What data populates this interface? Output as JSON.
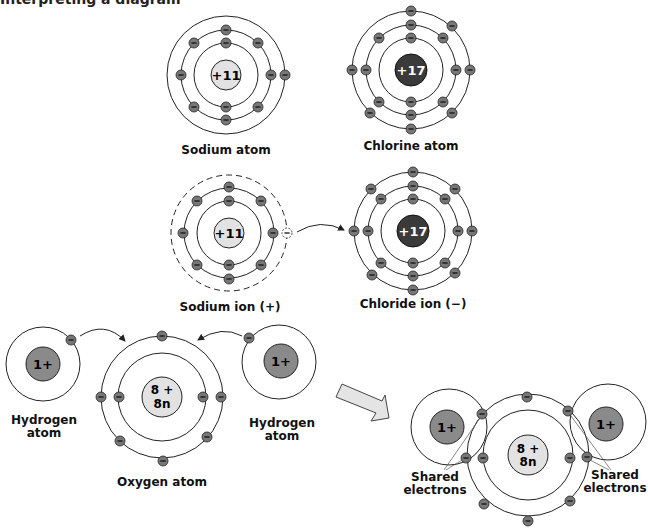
{
  "header": {
    "clipped_text": "Interpreting a diagram"
  },
  "colors": {
    "light_nucleus": "#e2e2e2",
    "dark_nucleus": "#3a3a3a",
    "mid_nucleus": "#8a8a8a",
    "electron": "#777777",
    "arrow_fill": "#e4e4e4"
  },
  "panels": {
    "sodium_atom": {
      "label": "Sodium atom",
      "nucleus": "+11",
      "shells": [
        2,
        8,
        1
      ]
    },
    "chlorine_atom": {
      "label": "Chlorine atom",
      "nucleus": "+17",
      "shells": [
        2,
        8,
        7
      ]
    },
    "sodium_ion": {
      "label": "Sodium ion (+)",
      "nucleus": "+11",
      "shells": [
        2,
        8
      ],
      "lost_electron": "−"
    },
    "chloride_ion": {
      "label": "Chloride ion (−)",
      "nucleus": "+17",
      "shells": [
        2,
        8,
        8
      ]
    },
    "hydrogen_left": {
      "label_line1": "Hydrogen",
      "label_line2": "atom",
      "nucleus": "1+"
    },
    "oxygen_atom": {
      "label": "Oxygen atom",
      "nucleus_line1": "8 +",
      "nucleus_line2": "8n",
      "shells": [
        2,
        6
      ]
    },
    "hydrogen_right": {
      "label_line1": "Hydrogen",
      "label_line2": "atom",
      "nucleus": "1+"
    },
    "water_molecule": {
      "nucleus_h": "1+",
      "nucleus_o_line1": "8 +",
      "nucleus_o_line2": "8n",
      "shared_left_line1": "Shared",
      "shared_left_line2": "electrons",
      "shared_right_line1": "Shared",
      "shared_right_line2": "electrons"
    }
  },
  "electron_symbol": "−"
}
